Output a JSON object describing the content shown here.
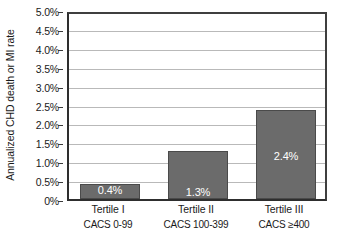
{
  "chart_data": {
    "type": "bar",
    "title": "",
    "subtitle": "",
    "xlabel": "",
    "ylabel": "Annualized CHD death or MI rate",
    "ylim": [
      0,
      5.0
    ],
    "y_unit": "%",
    "grid": true,
    "legend": "none",
    "orientation": "vertical",
    "categories": [
      "Tertile I",
      "Tertile II",
      "Tertile III"
    ],
    "category_sublabels": [
      "CACS 0-99",
      "CACS 100-399",
      "CACS ≥400"
    ],
    "values": [
      0.4,
      1.3,
      2.4
    ],
    "data_labels": [
      "0.4%",
      "1.3%",
      "2.4%"
    ],
    "y_ticks": [
      0,
      0.5,
      1.0,
      1.5,
      2.0,
      2.5,
      3.0,
      3.5,
      4.0,
      4.5,
      5.0
    ],
    "y_tick_labels": [
      "0%",
      "0.5%",
      "1.0%",
      "1.5%",
      "2.0%",
      "2.5%",
      "3.0%",
      "3.5%",
      "4.0%",
      "4.5%",
      "5.0%"
    ],
    "colors": {
      "bar_fill": "#6b6b6b",
      "bar_stroke": "#4a4a4a",
      "gridline": "#b9b9b9",
      "axis": "#2e2e2e",
      "plot_background": "#ffffff",
      "data_label_text": "#ffffff",
      "text": "#1a1a1a"
    }
  },
  "axis": {
    "y_title": "Annualized CHD death or MI rate"
  },
  "ticks": {
    "t0": "0%",
    "t1": "0.5%",
    "t2": "1.0%",
    "t3": "1.5%",
    "t4": "2.0%",
    "t5": "2.5%",
    "t6": "3.0%",
    "t7": "3.5%",
    "t8": "4.0%",
    "t9": "4.5%",
    "t10": "5.0%"
  },
  "bars": {
    "b0": {
      "label": "0.4%",
      "name": "Tertile I",
      "sub": "CACS 0-99"
    },
    "b1": {
      "label": "1.3%",
      "name": "Tertile II",
      "sub": "CACS 100-399"
    },
    "b2": {
      "label": "2.4%",
      "name": "Tertile III",
      "sub": "CACS ≥400"
    }
  }
}
